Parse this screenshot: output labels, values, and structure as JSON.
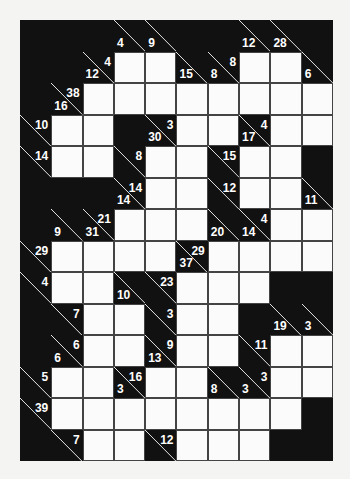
{
  "puzzle": {
    "type": "kakuro",
    "rows": 14,
    "cols": 10,
    "colors": {
      "background": "#f4f4f2",
      "block": "#111111",
      "cell": "#fbfbfb",
      "grid_line": "#444444",
      "clue_text": "#ffffff"
    },
    "legend": "Each row of the grid: 'B' = black block, 'W' = white entry cell, objects = clue cell with down (d) / right (r) sums",
    "grid": [
      [
        "B",
        "B",
        "B",
        {
          "d": 4
        },
        {
          "d": 9
        },
        "B",
        "B",
        {
          "d": 12
        },
        {
          "d": 28
        },
        "B"
      ],
      [
        "B",
        "B",
        {
          "d": 12,
          "r": 4
        },
        "W",
        "W",
        {
          "d": 15
        },
        {
          "d": 8,
          "r": 8
        },
        "W",
        "W",
        {
          "d": 6
        }
      ],
      [
        "B",
        {
          "d": 16,
          "r": 38
        },
        "W",
        "W",
        "W",
        "W",
        "W",
        "W",
        "W",
        "W"
      ],
      [
        {
          "r": 10
        },
        "W",
        "W",
        "B",
        {
          "d": 30,
          "r": 3
        },
        "W",
        "W",
        {
          "d": 17,
          "r": 4
        },
        "W",
        "W"
      ],
      [
        {
          "r": 14
        },
        "W",
        "W",
        {
          "r": 8
        },
        "W",
        "W",
        {
          "r": 15
        },
        "W",
        "W",
        "B"
      ],
      [
        "B",
        "B",
        "B",
        {
          "d": 14,
          "r": 14
        },
        "W",
        "W",
        {
          "r": 12
        },
        "W",
        "W",
        {
          "d": 11
        }
      ],
      [
        "B",
        {
          "d": 9
        },
        {
          "d": 31,
          "r": 21
        },
        "W",
        "W",
        "W",
        {
          "d": 20
        },
        {
          "d": 14,
          "r": 4
        },
        "W",
        "W"
      ],
      [
        {
          "r": 29
        },
        "W",
        "W",
        "W",
        "W",
        {
          "d": 37,
          "r": 29
        },
        "W",
        "W",
        "W",
        "W"
      ],
      [
        {
          "r": 4
        },
        "W",
        "W",
        {
          "d": 10
        },
        {
          "r": 23
        },
        "W",
        "W",
        "W",
        "B",
        "B"
      ],
      [
        "B",
        {
          "r": 7
        },
        "W",
        "W",
        {
          "r": 3
        },
        "W",
        "W",
        "B",
        {
          "d": 19
        },
        {
          "d": 3
        }
      ],
      [
        "B",
        {
          "d": 6,
          "r": 6
        },
        "W",
        "W",
        {
          "d": 13,
          "r": 9
        },
        "W",
        "W",
        {
          "r": 11
        },
        "W",
        "W"
      ],
      [
        {
          "r": 5
        },
        "W",
        "W",
        {
          "d": 3,
          "r": 16
        },
        "W",
        "W",
        {
          "d": 8
        },
        {
          "d": 3,
          "r": 3
        },
        "W",
        "W"
      ],
      [
        {
          "r": 39
        },
        "W",
        "W",
        "W",
        "W",
        "W",
        "W",
        "W",
        "W",
        "B"
      ],
      [
        "B",
        {
          "r": 7
        },
        "W",
        "W",
        {
          "r": 12
        },
        "W",
        "W",
        "W",
        "B",
        "B"
      ]
    ]
  }
}
